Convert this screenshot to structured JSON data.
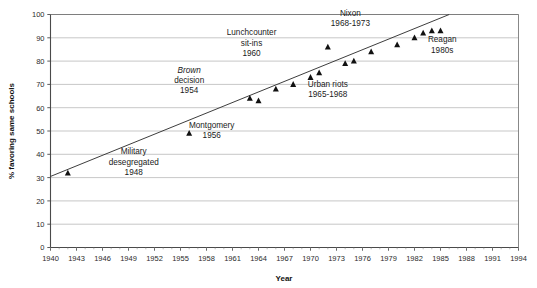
{
  "chart_data": {
    "type": "scatter",
    "title": "",
    "xlabel": "Year",
    "ylabel": "% favoring same schools",
    "xlim": [
      1940,
      1994
    ],
    "ylim": [
      0,
      100
    ],
    "grid": true,
    "grid_axis": "y",
    "legend": "none",
    "xticks": [
      1940,
      1943,
      1946,
      1949,
      1952,
      1955,
      1958,
      1961,
      1964,
      1967,
      1970,
      1973,
      1976,
      1979,
      1982,
      1985,
      1988,
      1991,
      1994
    ],
    "yticks": [
      0,
      10,
      20,
      30,
      40,
      50,
      60,
      70,
      80,
      90,
      100
    ],
    "marker": "triangle",
    "marker_color": "#111111",
    "series": [
      {
        "name": "% favoring same schools",
        "points": [
          {
            "x": 1942,
            "y": 32
          },
          {
            "x": 1956,
            "y": 49
          },
          {
            "x": 1963,
            "y": 64
          },
          {
            "x": 1964,
            "y": 63
          },
          {
            "x": 1966,
            "y": 68
          },
          {
            "x": 1968,
            "y": 70
          },
          {
            "x": 1970,
            "y": 73
          },
          {
            "x": 1971,
            "y": 75
          },
          {
            "x": 1972,
            "y": 86
          },
          {
            "x": 1974,
            "y": 79
          },
          {
            "x": 1975,
            "y": 80
          },
          {
            "x": 1977,
            "y": 84
          },
          {
            "x": 1980,
            "y": 87
          },
          {
            "x": 1982,
            "y": 90
          },
          {
            "x": 1983,
            "y": 92
          },
          {
            "x": 1984,
            "y": 93
          },
          {
            "x": 1985,
            "y": 93
          }
        ]
      }
    ],
    "trendline": {
      "x1": 1940,
      "y1": 30.5,
      "x2": 1986,
      "y2": 100
    },
    "annotations": [
      {
        "id": "military",
        "lines": [
          "Military",
          "desegregated",
          "1948"
        ],
        "italic_first": false,
        "x": 1949.6,
        "y": 40.0
      },
      {
        "id": "montgomery",
        "lines": [
          "Montgomery",
          "1956"
        ],
        "italic_first": false,
        "x": 1958.6,
        "y": 51.5
      },
      {
        "id": "brown",
        "lines": [
          "Brown",
          "decision",
          "1954"
        ],
        "italic_first": true,
        "x": 1956.0,
        "y": 75.0
      },
      {
        "id": "lunchcounter",
        "lines": [
          "Lunchcounter",
          "sit-ins",
          "1960"
        ],
        "italic_first": false,
        "x": 1963.2,
        "y": 91.0
      },
      {
        "id": "urban-riots",
        "lines": [
          "Urban riots",
          "1965-1968"
        ],
        "italic_first": false,
        "x": 1972.0,
        "y": 69.0
      },
      {
        "id": "nixon",
        "lines": [
          "Nixon",
          "1968-1973"
        ],
        "italic_first": false,
        "x": 1974.6,
        "y": 99.5
      },
      {
        "id": "reagan",
        "lines": [
          "Reagan",
          "1980s"
        ],
        "italic_first": false,
        "x": 1985.2,
        "y": 88.0
      }
    ]
  },
  "axis": {
    "x_title": "Year",
    "y_title": "% favoring same schools"
  }
}
